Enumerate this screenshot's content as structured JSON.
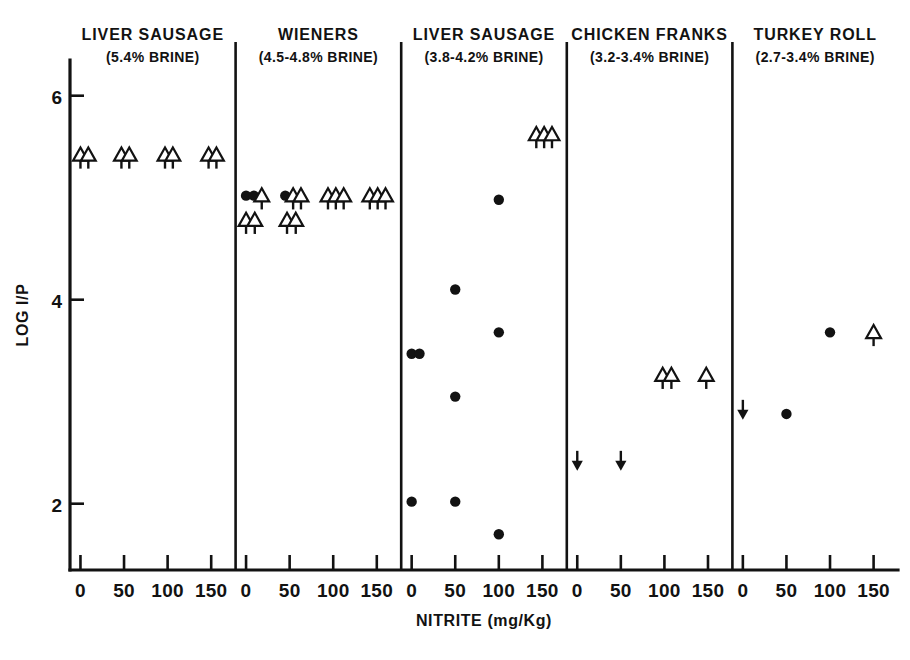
{
  "chart_data": {
    "type": "scatter",
    "title": "",
    "xlabel": "NITRITE (mg/Kg)",
    "ylabel": "LOG I/P",
    "ylim": [
      1.35,
      6.35
    ],
    "yticks": [
      2,
      4,
      6
    ],
    "ytick_labels": [
      "2",
      "4",
      "6"
    ],
    "xlim": [
      -12,
      178
    ],
    "xticks": [
      0,
      50,
      100,
      150
    ],
    "xtick_labels": [
      "0",
      "50",
      "100",
      "150"
    ],
    "grid": false,
    "legend": "none",
    "panel_layout": "5 side-by-side panels sharing one y-axis",
    "marker_meanings": {
      "filled-circle": "measured value",
      "open-triangle-down-stem": "value at or above plotted level (censored high)",
      "down-arrow": "value at or below plotted level (censored low)"
    },
    "panels": [
      {
        "title": "LIVER SAUSAGE",
        "subtitle": "(5.4% BRINE)",
        "brine_percent": "5.4",
        "points": [
          {
            "x": 0,
            "y": 5.42,
            "marker": "open-triangle"
          },
          {
            "x": 9,
            "y": 5.42,
            "marker": "open-triangle"
          },
          {
            "x": 47,
            "y": 5.42,
            "marker": "open-triangle"
          },
          {
            "x": 56,
            "y": 5.42,
            "marker": "open-triangle"
          },
          {
            "x": 97,
            "y": 5.42,
            "marker": "open-triangle"
          },
          {
            "x": 106,
            "y": 5.42,
            "marker": "open-triangle"
          },
          {
            "x": 147,
            "y": 5.42,
            "marker": "open-triangle"
          },
          {
            "x": 156,
            "y": 5.42,
            "marker": "open-triangle"
          }
        ]
      },
      {
        "title": "WIENERS",
        "subtitle": "(4.5-4.8% BRINE)",
        "brine_percent": "4.5-4.8",
        "points": [
          {
            "x": 0,
            "y": 5.02,
            "marker": "filled-circle"
          },
          {
            "x": 9,
            "y": 5.02,
            "marker": "filled-circle"
          },
          {
            "x": 18,
            "y": 5.02,
            "marker": "open-triangle"
          },
          {
            "x": 0,
            "y": 4.78,
            "marker": "open-triangle"
          },
          {
            "x": 10,
            "y": 4.78,
            "marker": "open-triangle"
          },
          {
            "x": 45,
            "y": 5.02,
            "marker": "filled-circle"
          },
          {
            "x": 54,
            "y": 5.02,
            "marker": "open-triangle"
          },
          {
            "x": 63,
            "y": 5.02,
            "marker": "open-triangle"
          },
          {
            "x": 47,
            "y": 4.78,
            "marker": "open-triangle"
          },
          {
            "x": 57,
            "y": 4.78,
            "marker": "open-triangle"
          },
          {
            "x": 94,
            "y": 5.02,
            "marker": "open-triangle"
          },
          {
            "x": 103,
            "y": 5.02,
            "marker": "open-triangle"
          },
          {
            "x": 112,
            "y": 5.02,
            "marker": "open-triangle"
          },
          {
            "x": 142,
            "y": 5.02,
            "marker": "open-triangle"
          },
          {
            "x": 151,
            "y": 5.02,
            "marker": "open-triangle"
          },
          {
            "x": 160,
            "y": 5.02,
            "marker": "open-triangle"
          }
        ]
      },
      {
        "title": "LIVER SAUSAGE",
        "subtitle": "(3.8-4.2% BRINE)",
        "brine_percent": "3.8-4.2",
        "points": [
          {
            "x": 0,
            "y": 3.47,
            "marker": "filled-circle"
          },
          {
            "x": 9,
            "y": 3.47,
            "marker": "filled-circle"
          },
          {
            "x": 0,
            "y": 2.02,
            "marker": "filled-circle"
          },
          {
            "x": 50,
            "y": 4.1,
            "marker": "filled-circle"
          },
          {
            "x": 50,
            "y": 3.05,
            "marker": "filled-circle"
          },
          {
            "x": 50,
            "y": 2.02,
            "marker": "filled-circle"
          },
          {
            "x": 100,
            "y": 4.98,
            "marker": "filled-circle"
          },
          {
            "x": 100,
            "y": 3.68,
            "marker": "filled-circle"
          },
          {
            "x": 100,
            "y": 1.7,
            "marker": "filled-circle"
          },
          {
            "x": 143,
            "y": 5.62,
            "marker": "open-triangle"
          },
          {
            "x": 152,
            "y": 5.62,
            "marker": "open-triangle"
          },
          {
            "x": 161,
            "y": 5.62,
            "marker": "open-triangle"
          }
        ]
      },
      {
        "title": "CHICKEN FRANKS",
        "subtitle": "(3.2-3.4% BRINE)",
        "brine_percent": "3.2-3.4",
        "points": [
          {
            "x": 0,
            "y": 2.43,
            "marker": "down-arrow"
          },
          {
            "x": 50,
            "y": 2.43,
            "marker": "down-arrow"
          },
          {
            "x": 98,
            "y": 3.26,
            "marker": "open-triangle"
          },
          {
            "x": 108,
            "y": 3.26,
            "marker": "open-triangle"
          },
          {
            "x": 148,
            "y": 3.26,
            "marker": "open-triangle"
          }
        ]
      },
      {
        "title": "TURKEY ROLL",
        "subtitle": "(2.7-3.4% BRINE)",
        "brine_percent": "2.7-3.4",
        "points": [
          {
            "x": 0,
            "y": 2.93,
            "marker": "down-arrow"
          },
          {
            "x": 50,
            "y": 2.88,
            "marker": "filled-circle"
          },
          {
            "x": 100,
            "y": 3.68,
            "marker": "filled-circle"
          },
          {
            "x": 150,
            "y": 3.68,
            "marker": "open-triangle"
          }
        ]
      }
    ]
  }
}
